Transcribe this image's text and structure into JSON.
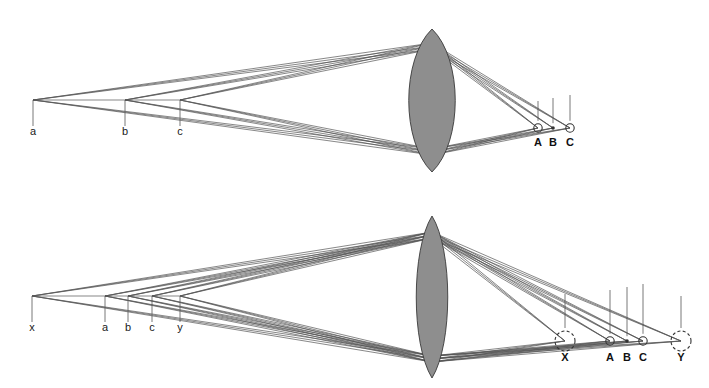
{
  "figure": {
    "width": 709,
    "height": 388,
    "background_color": "#ffffff",
    "ray_color": "#555555",
    "lens_fill_color": "#8e8e8e",
    "lens_stroke_color": "#3a3a3a",
    "label_color": "#1a1a1a"
  },
  "panels": [
    {
      "id": "top-panel",
      "name": "in-focus-panel",
      "lens": {
        "name": "biconvex-lens",
        "center_x": 432,
        "top_y": 29,
        "bottom_y": 172,
        "half_width": 31,
        "shape": "biconvex"
      },
      "object_points": [
        {
          "label": "a",
          "x": 33,
          "y": 100,
          "tick_top": 100,
          "tick_bottom": 126
        },
        {
          "label": "b",
          "x": 125,
          "y": 100,
          "tick_top": 100,
          "tick_bottom": 126
        },
        {
          "label": "c",
          "x": 180,
          "y": 100,
          "tick_top": 100,
          "tick_bottom": 126
        }
      ],
      "object_label_y": 135,
      "image_points": [
        {
          "label": "A",
          "x": 538,
          "y": 128,
          "marker": "circle",
          "radius": 4.2,
          "drop_top": 101
        },
        {
          "label": "B",
          "x": 553,
          "y": 128,
          "marker": "dot",
          "radius": 1.8,
          "drop_top": 98
        },
        {
          "label": "C",
          "x": 570,
          "y": 128,
          "marker": "circle",
          "radius": 4.2,
          "drop_top": 95
        }
      ],
      "image_label_y": 146,
      "ray_fan_apex_top_y": 43,
      "ray_fan_apex_bottom_y": 155
    },
    {
      "id": "bottom-panel",
      "name": "defocus-panel",
      "lens": {
        "name": "biconvex-lens",
        "center_x": 432,
        "top_y": 216,
        "bottom_y": 378,
        "half_width": 21,
        "shape": "biconvex"
      },
      "object_points": [
        {
          "label": "x",
          "x": 32,
          "y": 296,
          "tick_top": 296,
          "tick_bottom": 322
        },
        {
          "label": "a",
          "x": 105,
          "y": 296,
          "tick_top": 296,
          "tick_bottom": 322
        },
        {
          "label": "b",
          "x": 128,
          "y": 296,
          "tick_top": 296,
          "tick_bottom": 322
        },
        {
          "label": "c",
          "x": 152,
          "y": 296,
          "tick_top": 296,
          "tick_bottom": 322
        },
        {
          "label": "y",
          "x": 180,
          "y": 296,
          "tick_top": 296,
          "tick_bottom": 322
        }
      ],
      "object_label_y": 331,
      "image_points": [
        {
          "label": "X",
          "x": 565,
          "y": 341,
          "marker": "dashed-circle",
          "radius": 10,
          "drop_top": 294
        },
        {
          "label": "A",
          "x": 610,
          "y": 341,
          "marker": "circle",
          "radius": 4.2,
          "drop_top": 290
        },
        {
          "label": "B",
          "x": 627,
          "y": 341,
          "marker": "dot",
          "radius": 1.8,
          "drop_top": 287
        },
        {
          "label": "C",
          "x": 643,
          "y": 341,
          "marker": "circle",
          "radius": 4.2,
          "drop_top": 284
        },
        {
          "label": "Y",
          "x": 681,
          "y": 341,
          "marker": "dashed-circle",
          "radius": 10,
          "drop_top": 296
        }
      ],
      "image_label_y": 361,
      "ray_fan_apex_top_y": 232,
      "ray_fan_apex_bottom_y": 362
    }
  ]
}
